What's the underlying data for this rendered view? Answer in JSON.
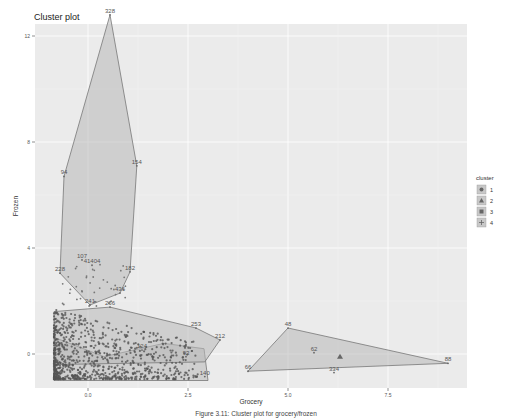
{
  "chart_data": {
    "type": "scatter",
    "title": "Cluster plot",
    "xlabel": "Grocery",
    "ylabel": "Frozen",
    "xlim": [
      -1.0,
      9.2
    ],
    "ylim": [
      -1.25,
      12.6
    ],
    "x_ticks": [
      0.0,
      2.5,
      5.0,
      7.5
    ],
    "x_tick_labels": [
      "0.0",
      "2.5",
      "5.0",
      "7.5"
    ],
    "y_ticks": [
      0,
      4,
      8,
      12
    ],
    "y_tick_labels": [
      "0",
      "4",
      "8",
      "12"
    ],
    "grid": true,
    "legend_title": "cluster",
    "legend_position": "right",
    "legend": [
      {
        "label": "1",
        "shape": "circle"
      },
      {
        "label": "2",
        "shape": "triangle"
      },
      {
        "label": "3",
        "shape": "square"
      },
      {
        "label": "4",
        "shape": "plus"
      }
    ],
    "hulls": [
      {
        "cluster": "1",
        "points": [
          [
            -0.85,
            -1.0
          ],
          [
            3.0,
            -1.0
          ],
          [
            2.9,
            0.2
          ],
          [
            1.9,
            0.4
          ],
          [
            0.4,
            -0.1
          ],
          [
            -0.8,
            0.6
          ]
        ]
      },
      {
        "cluster": "2",
        "points": [
          [
            5.0,
            0.98
          ],
          [
            9.0,
            -0.35
          ],
          [
            4.0,
            -0.65
          ]
        ]
      },
      {
        "cluster": "3",
        "points": [
          [
            0.55,
            12.8
          ],
          [
            1.22,
            7.1
          ],
          [
            1.05,
            3.1
          ],
          [
            0.8,
            2.3
          ],
          [
            0.05,
            1.85
          ],
          [
            -0.7,
            3.05
          ],
          [
            -0.6,
            6.7
          ]
        ]
      },
      {
        "cluster": "4",
        "points": [
          [
            0.55,
            1.77
          ],
          [
            2.7,
            0.98
          ],
          [
            3.3,
            0.53
          ],
          [
            2.92,
            -0.3
          ],
          [
            -0.85,
            -0.4
          ],
          [
            -0.85,
            1.6
          ]
        ]
      }
    ],
    "labeled_points": [
      {
        "id": "328",
        "x": 0.55,
        "y": 12.8,
        "cluster": "3"
      },
      {
        "id": "154",
        "x": 1.22,
        "y": 7.1,
        "cluster": "3"
      },
      {
        "id": "94",
        "x": -0.6,
        "y": 6.7,
        "cluster": "3"
      },
      {
        "id": "182",
        "x": 1.05,
        "y": 3.1,
        "cluster": "3"
      },
      {
        "id": "228",
        "x": -0.7,
        "y": 3.05,
        "cluster": "3"
      },
      {
        "id": "436",
        "x": 0.8,
        "y": 2.3,
        "cluster": "3"
      },
      {
        "id": "241",
        "x": 0.05,
        "y": 1.85,
        "cluster": "3"
      },
      {
        "id": "107",
        "x": -0.15,
        "y": 3.55,
        "cluster": "3"
      },
      {
        "id": "41404",
        "x": 0.1,
        "y": 3.35,
        "cluster": "3"
      },
      {
        "id": "266",
        "x": 0.55,
        "y": 1.77,
        "cluster": "4"
      },
      {
        "id": "253",
        "x": 2.7,
        "y": 0.98,
        "cluster": "4"
      },
      {
        "id": "212",
        "x": 3.3,
        "y": 0.53,
        "cluster": "4"
      },
      {
        "id": "124",
        "x": 1.35,
        "y": 0.15,
        "cluster": "4"
      },
      {
        "id": "93",
        "x": 2.45,
        "y": -0.1,
        "cluster": "1"
      },
      {
        "id": "140",
        "x": 2.92,
        "y": -0.85,
        "cluster": "1"
      },
      {
        "id": "48",
        "x": 5.0,
        "y": 0.98,
        "cluster": "2"
      },
      {
        "id": "62",
        "x": 5.65,
        "y": 0.05,
        "cluster": "2"
      },
      {
        "id": "334",
        "x": 6.15,
        "y": -0.7,
        "cluster": "2"
      },
      {
        "id": "66",
        "x": 4.0,
        "y": -0.65,
        "cluster": "2"
      },
      {
        "id": "88",
        "x": 9.0,
        "y": -0.35,
        "cluster": "2"
      }
    ],
    "centroids": [
      {
        "cluster": "2",
        "x": 6.3,
        "y": -0.1
      }
    ]
  },
  "caption": "Figure 3.11: Cluster plot for grocery/frozen"
}
